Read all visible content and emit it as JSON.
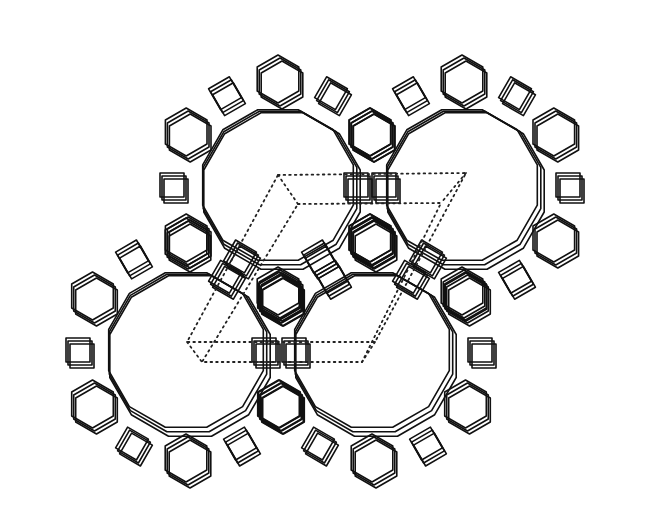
{
  "figure": {
    "type": "crystal-framework-projection",
    "description": "Zeolite framework line drawing viewed along the main channel axis showing four large 12-ring channels, hexagonal cancrinite-type cages and double six-rings, with dotted unit-cell outline",
    "background": "#ffffff",
    "line_color": "#111111",
    "channels": [
      {
        "id": "channel-upper-left",
        "cx": 278,
        "cy": 185,
        "r": 78
      },
      {
        "id": "channel-upper-right",
        "cx": 462,
        "cy": 185,
        "r": 78
      },
      {
        "id": "channel-lower-left",
        "cx": 186,
        "cy": 350,
        "r": 80
      },
      {
        "id": "channel-lower-right",
        "cx": 372,
        "cy": 350,
        "r": 80
      }
    ],
    "unit_cell": {
      "style": "dotted",
      "outer": [
        [
          278,
          175
        ],
        [
          466,
          173
        ],
        [
          375,
          342
        ],
        [
          187,
          342
        ]
      ],
      "inner": [
        [
          298,
          204
        ],
        [
          441,
          203
        ],
        [
          362,
          362
        ],
        [
          202,
          362
        ]
      ]
    }
  }
}
